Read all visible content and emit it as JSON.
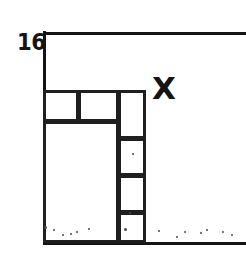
{
  "figure": {
    "background_color": "#ffffff",
    "ink_color": "#1f1f1f",
    "width": 246,
    "height": 255
  },
  "labels": {
    "axis_value": "16",
    "region_label": "X"
  },
  "axes": {
    "vertical": {
      "x": 43,
      "y_top": 31,
      "y_bottom": 245,
      "thickness": 3
    },
    "horizontal_top": {
      "y": 32,
      "x_left": 43,
      "x_right": 246,
      "thickness": 3
    },
    "horizontal_bottom": {
      "y": 242,
      "x_left": 43,
      "x_right": 246,
      "thickness": 3
    }
  },
  "boxes": [
    {
      "name": "top-left-cell",
      "x": 43,
      "y": 90,
      "w": 36,
      "h": 32
    },
    {
      "name": "top-middle-cell",
      "x": 78,
      "y": 90,
      "w": 41,
      "h": 32
    },
    {
      "name": "large-lower-cell",
      "x": 43,
      "y": 121,
      "w": 76,
      "h": 122
    },
    {
      "name": "right-col-cell-1",
      "x": 118,
      "y": 90,
      "w": 28,
      "h": 49
    },
    {
      "name": "right-col-cell-2",
      "x": 118,
      "y": 138,
      "w": 28,
      "h": 38
    },
    {
      "name": "right-col-cell-3",
      "x": 118,
      "y": 175,
      "w": 28,
      "h": 38
    },
    {
      "name": "right-col-cell-4",
      "x": 118,
      "y": 212,
      "w": 28,
      "h": 31
    }
  ],
  "specks": [
    {
      "x": 44,
      "y": 226,
      "d": 3
    },
    {
      "x": 53,
      "y": 229,
      "d": 2
    },
    {
      "x": 62,
      "y": 234,
      "d": 2
    },
    {
      "x": 70,
      "y": 233,
      "d": 2
    },
    {
      "x": 76,
      "y": 231,
      "d": 2
    },
    {
      "x": 88,
      "y": 228,
      "d": 2
    },
    {
      "x": 124,
      "y": 228,
      "d": 3
    },
    {
      "x": 129,
      "y": 212,
      "d": 2
    },
    {
      "x": 158,
      "y": 230,
      "d": 2
    },
    {
      "x": 176,
      "y": 236,
      "d": 2
    },
    {
      "x": 184,
      "y": 231,
      "d": 2
    },
    {
      "x": 200,
      "y": 232,
      "d": 2
    },
    {
      "x": 206,
      "y": 229,
      "d": 2
    },
    {
      "x": 222,
      "y": 231,
      "d": 2
    },
    {
      "x": 231,
      "y": 234,
      "d": 2
    },
    {
      "x": 132,
      "y": 153,
      "d": 2
    }
  ]
}
